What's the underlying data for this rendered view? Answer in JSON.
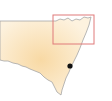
{
  "map": {
    "region": "New South Wales",
    "colors": {
      "land_center": "#f9dcaa",
      "land_edge": "#fdf1dc",
      "border": "#a8a8a8",
      "highlight_box": "#e07a7a",
      "marker": "#111111"
    },
    "highlight_box": {
      "x": 53,
      "y": 15,
      "width": 41,
      "height": 29
    },
    "marker": {
      "x": 70,
      "y": 66,
      "r": 2.6
    }
  }
}
